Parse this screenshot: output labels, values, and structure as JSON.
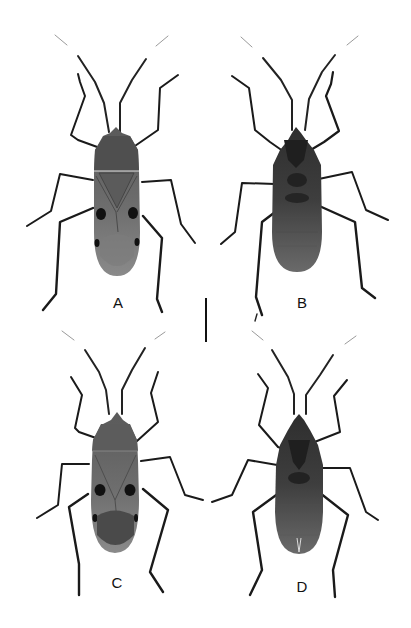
{
  "figure": {
    "panels": [
      {
        "id": "A",
        "label": "A",
        "view": "dorsal",
        "sex": "specimen 1"
      },
      {
        "id": "B",
        "label": "B",
        "view": "ventral",
        "sex": "specimen 1"
      },
      {
        "id": "C",
        "label": "C",
        "view": "dorsal",
        "sex": "specimen 2"
      },
      {
        "id": "D",
        "label": "D",
        "view": "ventral",
        "sex": "specimen 2"
      }
    ],
    "scale_bar": {
      "orientation": "vertical",
      "label": ""
    },
    "colors": {
      "background": "#ffffff",
      "body_dark": "#3a3a3a",
      "body_mid": "#6e6e6e",
      "legs": "#1a1a1a"
    }
  }
}
